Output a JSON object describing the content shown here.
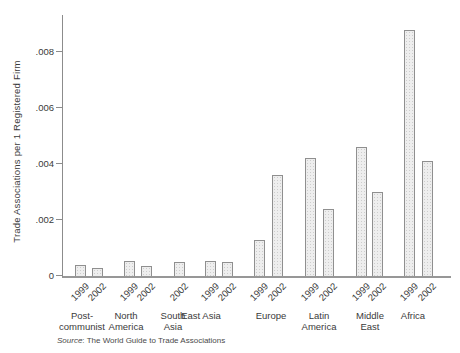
{
  "chart_data": {
    "type": "bar",
    "title": "",
    "ylabel": "Trade Associations per 1 Registered Firm",
    "xlabel": "",
    "grid": "off",
    "legend_position": "none (year labels under each bar)",
    "ylim": [
      0,
      0.0093
    ],
    "y_ticks": [
      "0",
      ".002",
      ".004",
      ".006",
      ".008"
    ],
    "y_tick_values": [
      0,
      0.002,
      0.004,
      0.006,
      0.008
    ],
    "categories": [
      "Post-communist",
      "North America",
      "South Asia",
      "East Asia",
      "Europe",
      "Latin America",
      "Middle East",
      "Africa"
    ],
    "category_label_lines": [
      [
        "Post-",
        "communist"
      ],
      [
        "North",
        "America"
      ],
      [
        "South",
        "Asia"
      ],
      [
        "East Asia"
      ],
      [
        "Europe"
      ],
      [
        "Latin",
        "America"
      ],
      [
        "Middle",
        "East"
      ],
      [
        "Africa"
      ]
    ],
    "series": [
      {
        "name": "1999",
        "values": [
          0.0004,
          0.00055,
          null,
          0.00055,
          0.0013,
          0.0042,
          0.0046,
          0.0088
        ]
      },
      {
        "name": "2002",
        "values": [
          0.0003,
          0.00035,
          0.0005,
          0.0005,
          0.0036,
          0.0024,
          0.003,
          0.0041
        ]
      }
    ],
    "source_note": {
      "label": "Source",
      "text": ": The World Guide to Trade Associations"
    },
    "colors": {
      "background": "#ffffff",
      "text": "#3a3a3a",
      "axis": "#8c8c8c",
      "baseline": "#979797",
      "bar_fill": "#eeeeee",
      "bar_border": "#8f8f8f"
    }
  }
}
